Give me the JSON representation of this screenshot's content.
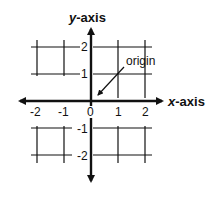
{
  "diagram": {
    "y_axis_label_var": "y",
    "y_axis_label_rest": "-axis",
    "x_axis_label_var": "x",
    "x_axis_label_rest": "-axis",
    "origin_label": "origin",
    "x_ticks": [
      "-2",
      "-1",
      "0",
      "1",
      "2"
    ],
    "y_ticks": [
      "2",
      "1",
      "-1",
      "-2"
    ],
    "colors": {
      "line": "#111111",
      "background": "#ffffff"
    }
  }
}
